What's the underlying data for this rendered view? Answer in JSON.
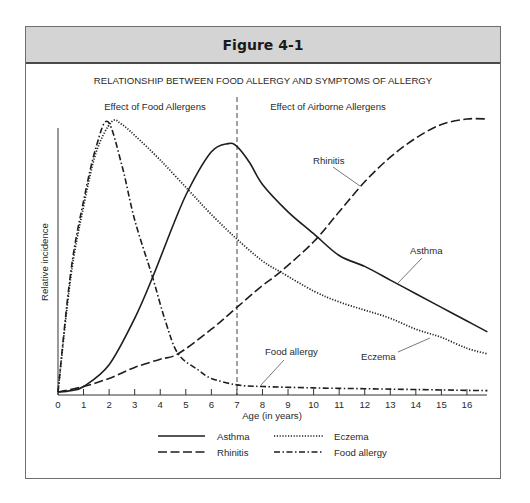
{
  "figure": {
    "label": "Figure 4-1",
    "title": "RELATIONSHIP BETWEEN FOOD ALLERGY AND SYMPTOMS OF ALLERGY",
    "region_left": "Effect of Food Allergens",
    "region_right": "Effect of Airborne Allergens",
    "xlabel": "Age (in years)",
    "ylabel": "Relative incidence"
  },
  "chart_data": {
    "type": "line",
    "title": "RELATIONSHIP BETWEEN FOOD ALLERGY AND SYMPTOMS OF ALLERGY",
    "xlabel": "Age (in years)",
    "ylabel": "Relative incidence",
    "xlim": [
      0,
      16.8
    ],
    "ylim": [
      0,
      100
    ],
    "x_ticks": [
      0,
      1,
      2,
      3,
      4,
      5,
      6,
      7,
      8,
      9,
      10,
      11,
      12,
      13,
      14,
      15,
      16
    ],
    "y_ticks": [],
    "grid": false,
    "legend_position": "bottom",
    "annotations": [
      {
        "type": "vline",
        "x": 7,
        "style": "dashed"
      },
      {
        "text": "Effect of Food Allergens",
        "region": "left of x=7"
      },
      {
        "text": "Effect of Airborne Allergens",
        "region": "right of x=7"
      },
      {
        "text": "Rhinitis",
        "points_to_x": 9.1
      },
      {
        "text": "Asthma",
        "points_to_x": 13.3
      },
      {
        "text": "Eczema",
        "points_to_x": 14.6
      },
      {
        "text": "Food allergy",
        "points_to_x": 8.0
      }
    ],
    "series": [
      {
        "name": "Asthma",
        "style": "solid",
        "x": [
          0,
          0.5,
          1,
          2,
          3,
          3.7,
          4.5,
          5.1,
          6,
          6.65,
          7,
          7.5,
          8,
          9,
          10,
          11,
          12,
          13,
          14,
          15,
          16,
          16.8
        ],
        "values": [
          0,
          0.5,
          2,
          10,
          27,
          42,
          61,
          74,
          88,
          91,
          90,
          84,
          76,
          66,
          58,
          50,
          46,
          41,
          36,
          31,
          26,
          22
        ]
      },
      {
        "name": "Rhinitis",
        "style": "dashed",
        "x": [
          0,
          1,
          2,
          3,
          4,
          4.7,
          6,
          7,
          8,
          8.7,
          10,
          11,
          12,
          13,
          14,
          15,
          16,
          16.8
        ],
        "values": [
          0,
          2,
          5,
          9,
          12,
          14,
          23,
          31,
          39,
          44,
          55,
          66,
          77,
          86,
          93,
          98,
          100,
          100
        ]
      },
      {
        "name": "Eczema",
        "style": "dotted",
        "x": [
          0,
          0.5,
          1,
          1.5,
          2.1,
          2.5,
          3,
          4,
          5.1,
          6,
          7,
          8,
          8.7,
          10,
          11,
          12,
          13,
          14,
          15,
          16,
          16.8
        ],
        "values": [
          0,
          42,
          68,
          88,
          99,
          98,
          94,
          85,
          74,
          65,
          56,
          48,
          44,
          37,
          33,
          30,
          27,
          23,
          20,
          16,
          14
        ]
      },
      {
        "name": "Food allergy",
        "style": "dash-dot",
        "x": [
          0,
          0.5,
          1,
          1.5,
          1.95,
          2.5,
          3,
          3.7,
          4.2,
          4.7,
          5.5,
          6,
          7,
          8,
          10,
          12,
          14,
          16,
          16.8
        ],
        "values": [
          0,
          44,
          70,
          90,
          99,
          83,
          63,
          42,
          26,
          14,
          8,
          5,
          2.6,
          2,
          1.5,
          1.2,
          0.9,
          0.6,
          0.5
        ]
      }
    ]
  },
  "legend": [
    {
      "label": "Asthma",
      "style": "solid"
    },
    {
      "label": "Eczema",
      "style": "dotted"
    },
    {
      "label": "Rhinitis",
      "style": "dashed"
    },
    {
      "label": "Food allergy",
      "style": "dash-dot"
    }
  ],
  "colors": {
    "header_bg": "#d4d4d4",
    "line": "#1e1e1e",
    "text": "#2a2a2a"
  }
}
